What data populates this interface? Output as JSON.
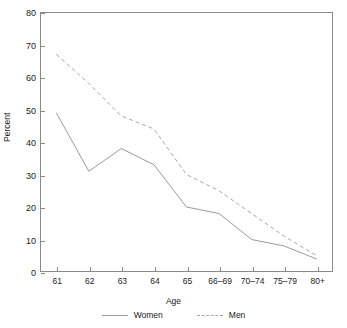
{
  "chart_data": {
    "type": "line",
    "title": "",
    "xlabel": "Age",
    "ylabel": "Percent",
    "categories": [
      "61",
      "62",
      "63",
      "64",
      "65",
      "66–69",
      "70–74",
      "75–79",
      "80+"
    ],
    "series": [
      {
        "name": "Women",
        "style": "solid",
        "color": "#9a9a9a",
        "values": [
          49,
          31,
          38,
          33,
          20,
          18,
          10,
          8,
          4
        ]
      },
      {
        "name": "Men",
        "style": "dashed",
        "color": "#a8a8a8",
        "values": [
          67,
          58,
          48,
          44,
          30,
          25,
          18,
          11,
          5
        ]
      }
    ],
    "ylim": [
      0,
      80
    ],
    "y_ticks": [
      0,
      10,
      20,
      30,
      40,
      50,
      60,
      70,
      80
    ],
    "y_tick_labels": [
      "0",
      "10",
      "20",
      "30",
      "40",
      "50",
      "60",
      "70",
      "80"
    ],
    "grid": false,
    "legend_position": "bottom"
  },
  "legend": {
    "items": [
      {
        "label": "Women",
        "swatch": "solid-line-swatch"
      },
      {
        "label": "Men",
        "swatch": "dashed-line-swatch"
      }
    ]
  },
  "axes": {
    "x_title": "Age",
    "y_title": "Percent"
  }
}
